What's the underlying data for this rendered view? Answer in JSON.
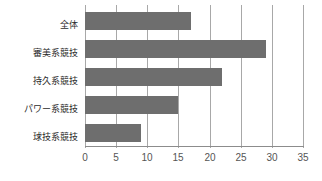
{
  "chart_data": {
    "type": "bar",
    "orientation": "horizontal",
    "title": "",
    "subtitle": "",
    "xlabel": "",
    "ylabel": "",
    "categories": [
      "全体",
      "審美系競技",
      "持久系競技",
      "パワー系競技",
      "球技系競技"
    ],
    "values": [
      17,
      29,
      22,
      15,
      9
    ],
    "series": [
      {
        "name": "",
        "values": [
          17,
          29,
          22,
          15,
          9
        ]
      }
    ],
    "xlim": [
      0,
      35
    ],
    "xticks": [
      0,
      5,
      10,
      15,
      20,
      25,
      30,
      35
    ],
    "xtick_labels": [
      "0",
      "5",
      "10",
      "15",
      "20",
      "25",
      "30",
      "35"
    ],
    "grid": true,
    "grid_axis": "x",
    "legend": false,
    "legend_position": "none",
    "annotations": [],
    "colors": {
      "bar": "#6e6e6e",
      "gridline": "#a8a8a8",
      "axis": "#8c8c8c",
      "label_text": "#2b2b2b",
      "tick_text": "#555555",
      "background": "#ffffff"
    }
  }
}
